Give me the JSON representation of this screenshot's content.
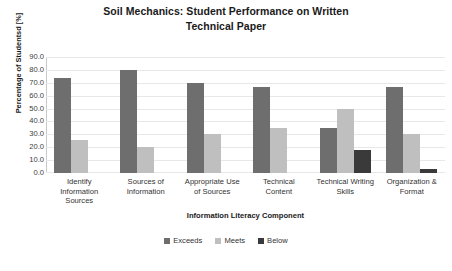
{
  "chart_data": {
    "type": "bar",
    "title": "Soil Mechanics: Student Performance on Written Technical Paper",
    "title_lines": [
      "Soil Mechanics: Student Performance on Written",
      "Technical Paper"
    ],
    "xlabel": "Information Literacy Component",
    "ylabel": "Percentage of Studentsd [%]",
    "ylim": [
      0,
      90
    ],
    "ytick_step": 10,
    "ytick_labels": [
      "90.0",
      "80.0",
      "70.0",
      "60.0",
      "50.0",
      "40.0",
      "30.0",
      "20.0",
      "10.0",
      "0.0"
    ],
    "grid": true,
    "grid_axis": "y",
    "legend_position": "bottom",
    "categories": [
      "Identify Information Sources",
      "Sources of Information",
      "Appropriate Use of Sources",
      "Technical Content",
      "Technical Writing Skills",
      "Organization & Format"
    ],
    "category_lines": [
      [
        "Identify",
        "Information",
        "Sources"
      ],
      [
        "Sources of",
        "Information"
      ],
      [
        "Appropriate Use",
        "of Sources"
      ],
      [
        "Technical",
        "Content"
      ],
      [
        "Technical Writing",
        "Skills"
      ],
      [
        "Organization &",
        "Format"
      ]
    ],
    "series": [
      {
        "name": "Exceeds",
        "color": "#6E6E6E",
        "values": [
          74,
          80,
          70,
          67,
          35,
          67
        ]
      },
      {
        "name": "Meets",
        "color": "#BFBFBF",
        "values": [
          26,
          20,
          30,
          35,
          50,
          30
        ]
      },
      {
        "name": "Below",
        "color": "#3A3A3A",
        "values": [
          0,
          0,
          0,
          0,
          18,
          3
        ]
      }
    ]
  }
}
